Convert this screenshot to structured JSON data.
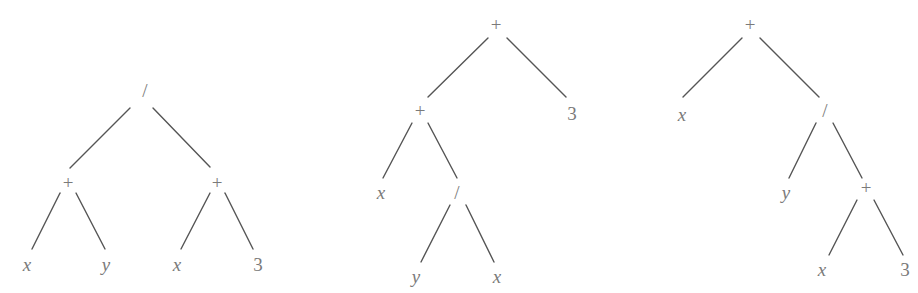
{
  "diagram": {
    "colors": {
      "edge": "#555555",
      "label": "#7a7a7a",
      "background": "#ffffff"
    },
    "trees": [
      {
        "id": "tree-1",
        "expression": "(x + y) / (x + 3)",
        "nodes": [
          {
            "id": "t1n0",
            "label": "/",
            "kind": "op",
            "x": 145,
            "y": 90
          },
          {
            "id": "t1n1",
            "label": "+",
            "kind": "op",
            "x": 68,
            "y": 182
          },
          {
            "id": "t1n2",
            "label": "+",
            "kind": "op",
            "x": 217,
            "y": 182
          },
          {
            "id": "t1n3",
            "label": "x",
            "kind": "var",
            "x": 27,
            "y": 264
          },
          {
            "id": "t1n4",
            "label": "y",
            "kind": "var",
            "x": 106,
            "y": 264
          },
          {
            "id": "t1n5",
            "label": "x",
            "kind": "var",
            "x": 177,
            "y": 264
          },
          {
            "id": "t1n6",
            "label": "3",
            "kind": "num",
            "x": 258,
            "y": 264
          }
        ],
        "edges": [
          {
            "from": "t1n0",
            "to": "t1n1",
            "x1": 130,
            "y1": 108,
            "x2": 70,
            "y2": 168
          },
          {
            "from": "t1n0",
            "to": "t1n2",
            "x1": 153,
            "y1": 108,
            "x2": 210,
            "y2": 167
          },
          {
            "from": "t1n1",
            "to": "t1n3",
            "x1": 60,
            "y1": 193,
            "x2": 32,
            "y2": 249
          },
          {
            "from": "t1n1",
            "to": "t1n4",
            "x1": 76,
            "y1": 193,
            "x2": 105,
            "y2": 249
          },
          {
            "from": "t1n2",
            "to": "t1n5",
            "x1": 210,
            "y1": 193,
            "x2": 181,
            "y2": 249
          },
          {
            "from": "t1n2",
            "to": "t1n6",
            "x1": 225,
            "y1": 193,
            "x2": 253,
            "y2": 249
          }
        ]
      },
      {
        "id": "tree-2",
        "expression": "(x + y / x) + 3",
        "nodes": [
          {
            "id": "t2n0",
            "label": "+",
            "kind": "op",
            "x": 496,
            "y": 24
          },
          {
            "id": "t2n1",
            "label": "+",
            "kind": "op",
            "x": 420,
            "y": 110
          },
          {
            "id": "t2n2",
            "label": "3",
            "kind": "num",
            "x": 572,
            "y": 113
          },
          {
            "id": "t2n3",
            "label": "x",
            "kind": "var",
            "x": 381,
            "y": 192
          },
          {
            "id": "t2n4",
            "label": "/",
            "kind": "op",
            "x": 457,
            "y": 192
          },
          {
            "id": "t2n5",
            "label": "y",
            "kind": "var",
            "x": 416,
            "y": 276
          },
          {
            "id": "t2n6",
            "label": "x",
            "kind": "var",
            "x": 497,
            "y": 276
          }
        ],
        "edges": [
          {
            "from": "t2n0",
            "to": "t2n1",
            "x1": 488,
            "y1": 38,
            "x2": 428,
            "y2": 97
          },
          {
            "from": "t2n0",
            "to": "t2n2",
            "x1": 507,
            "y1": 38,
            "x2": 566,
            "y2": 97
          },
          {
            "from": "t2n1",
            "to": "t2n3",
            "x1": 412,
            "y1": 123,
            "x2": 383,
            "y2": 178
          },
          {
            "from": "t2n1",
            "to": "t2n4",
            "x1": 428,
            "y1": 123,
            "x2": 457,
            "y2": 178
          },
          {
            "from": "t2n4",
            "to": "t2n5",
            "x1": 450,
            "y1": 205,
            "x2": 421,
            "y2": 262
          },
          {
            "from": "t2n4",
            "to": "t2n6",
            "x1": 466,
            "y1": 205,
            "x2": 494,
            "y2": 262
          }
        ]
      },
      {
        "id": "tree-3",
        "expression": "x + y / (x + 3)",
        "nodes": [
          {
            "id": "t3n0",
            "label": "+",
            "kind": "op",
            "x": 750,
            "y": 24
          },
          {
            "id": "t3n1",
            "label": "x",
            "kind": "var",
            "x": 682,
            "y": 114
          },
          {
            "id": "t3n2",
            "label": "/",
            "kind": "op",
            "x": 825,
            "y": 110
          },
          {
            "id": "t3n3",
            "label": "y",
            "kind": "var",
            "x": 786,
            "y": 192
          },
          {
            "id": "t3n4",
            "label": "+",
            "kind": "op",
            "x": 866,
            "y": 187
          },
          {
            "id": "t3n5",
            "label": "x",
            "kind": "var",
            "x": 822,
            "y": 269
          },
          {
            "id": "t3n6",
            "label": "3",
            "kind": "num",
            "x": 905,
            "y": 269
          }
        ],
        "edges": [
          {
            "from": "t3n0",
            "to": "t3n1",
            "x1": 742,
            "y1": 38,
            "x2": 683,
            "y2": 97
          },
          {
            "from": "t3n0",
            "to": "t3n2",
            "x1": 760,
            "y1": 38,
            "x2": 819,
            "y2": 97
          },
          {
            "from": "t3n2",
            "to": "t3n3",
            "x1": 816,
            "y1": 123,
            "x2": 789,
            "y2": 178
          },
          {
            "from": "t3n2",
            "to": "t3n4",
            "x1": 833,
            "y1": 123,
            "x2": 862,
            "y2": 178
          },
          {
            "from": "t3n4",
            "to": "t3n5",
            "x1": 857,
            "y1": 200,
            "x2": 829,
            "y2": 255
          },
          {
            "from": "t3n4",
            "to": "t3n6",
            "x1": 874,
            "y1": 200,
            "x2": 903,
            "y2": 255
          }
        ]
      }
    ]
  }
}
